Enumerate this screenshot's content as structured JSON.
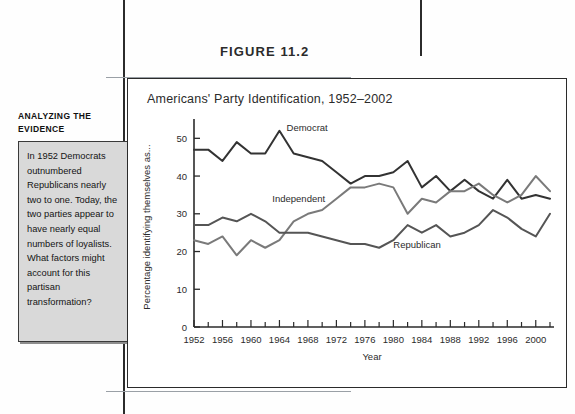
{
  "figure": {
    "number_label": "FIGURE 11.2",
    "title": "Americans' Party Identification, 1952–2002"
  },
  "sidebar": {
    "heading": "ANALYZING THE EVIDENCE",
    "body": "In 1952 Democrats outnumbered Republicans nearly two to one. Today, the two parties appear to have nearly equal numbers of loyalists. What factors might account for this partisan transformation?"
  },
  "chart_data": {
    "type": "line",
    "title": "Americans' Party Identification, 1952–2002",
    "xlabel": "Year",
    "ylabel": "Percentage identifying themselves as...",
    "xlim": [
      1952,
      2002
    ],
    "ylim": [
      0,
      53
    ],
    "yticks": [
      0,
      10,
      20,
      30,
      40,
      50
    ],
    "ytick_labels": [
      "0",
      "10",
      "20",
      "30",
      "40",
      "50"
    ],
    "xticks": [
      1952,
      1954,
      1956,
      1958,
      1960,
      1962,
      1964,
      1966,
      1968,
      1970,
      1972,
      1974,
      1976,
      1978,
      1980,
      1982,
      1984,
      1986,
      1988,
      1990,
      1992,
      1994,
      1996,
      1998,
      2000,
      2002
    ],
    "xtick_labels": [
      "1952",
      "1956",
      "1960",
      "1964",
      "1968",
      "1972",
      "1976",
      "1980",
      "1984",
      "1988",
      "1992",
      "1996",
      "2000"
    ],
    "xtick_label_years": [
      1952,
      1956,
      1960,
      1964,
      1968,
      1972,
      1976,
      1980,
      1984,
      1988,
      1992,
      1996,
      2000
    ],
    "grid": false,
    "legend": "inline-annotations",
    "x": [
      1952,
      1954,
      1956,
      1958,
      1960,
      1962,
      1964,
      1966,
      1968,
      1970,
      1972,
      1974,
      1976,
      1978,
      1980,
      1982,
      1984,
      1986,
      1988,
      1990,
      1992,
      1994,
      1996,
      1998,
      2000,
      2002
    ],
    "series": [
      {
        "name": "Democrat",
        "color": "#333333",
        "values": [
          47,
          47,
          44,
          49,
          46,
          46,
          52,
          46,
          45,
          44,
          41,
          38,
          40,
          40,
          41,
          44,
          37,
          40,
          36,
          39,
          36,
          34,
          39,
          34,
          35,
          34
        ],
        "label": "Democrat",
        "label_x": 1965,
        "label_y": 52
      },
      {
        "name": "Independent",
        "color": "#7a7a7a",
        "values": [
          23,
          22,
          24,
          19,
          23,
          21,
          23,
          28,
          30,
          31,
          34,
          37,
          37,
          38,
          37,
          30,
          34,
          33,
          36,
          36,
          38,
          35,
          33,
          35,
          40,
          36
        ],
        "label": "Independent",
        "label_x": 1963,
        "label_y": 33
      },
      {
        "name": "Republican",
        "color": "#555555",
        "values": [
          27,
          27,
          29,
          28,
          30,
          28,
          25,
          25,
          25,
          24,
          23,
          22,
          22,
          21,
          23,
          27,
          25,
          27,
          24,
          25,
          27,
          31,
          29,
          26,
          24,
          30
        ],
        "label": "Republican",
        "label_x": 1980,
        "label_y": 21
      }
    ]
  }
}
